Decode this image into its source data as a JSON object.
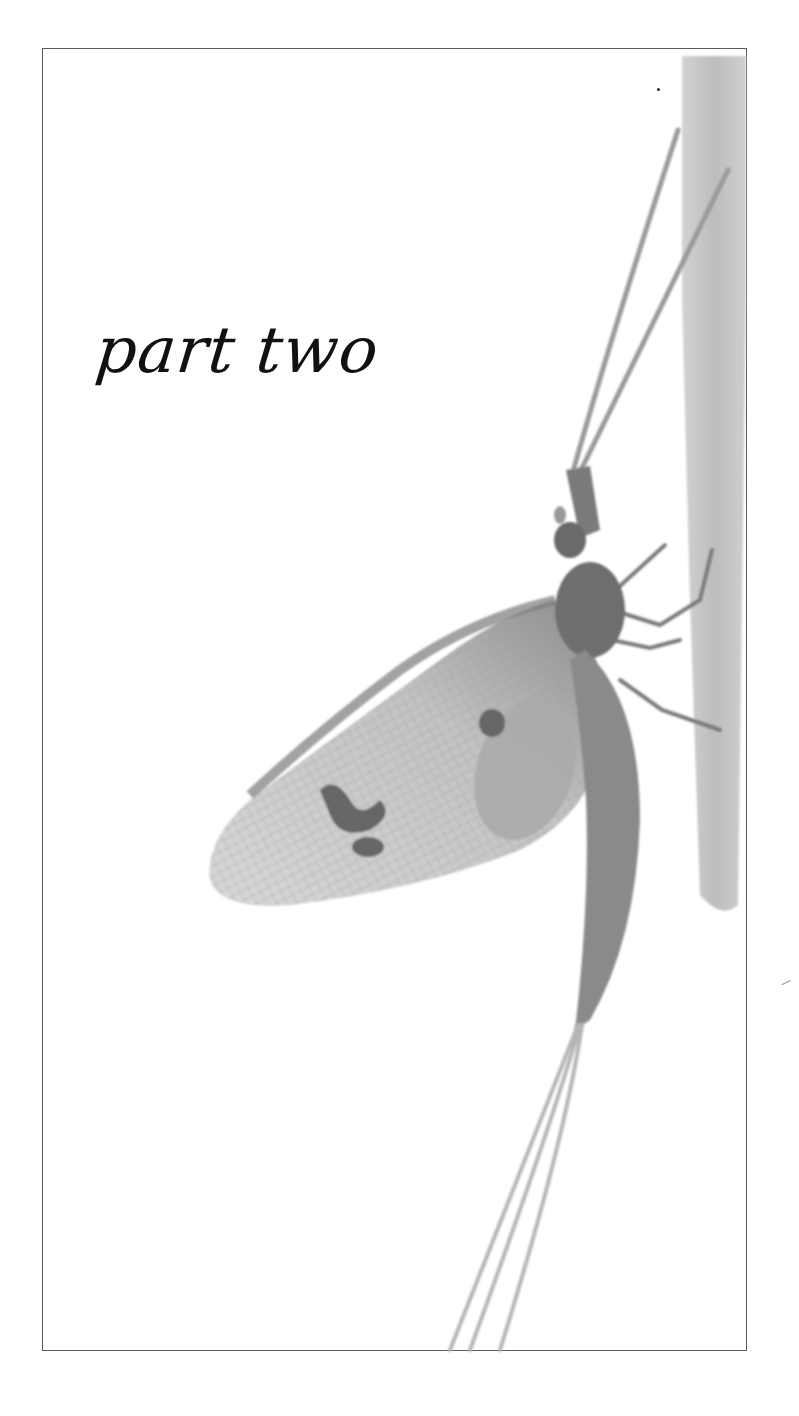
{
  "page": {
    "title": "part two",
    "illustration": {
      "subject": "mayfly-on-stem",
      "style": "grayscale-photograph"
    },
    "colors": {
      "frame": "#5a5a5a",
      "text": "#111111",
      "insect_dark": "#6e6e6e",
      "insect_mid": "#9a9a9a",
      "wing_light": "#cfcfcf",
      "stem": "#c4c4c4",
      "background": "#ffffff"
    }
  }
}
